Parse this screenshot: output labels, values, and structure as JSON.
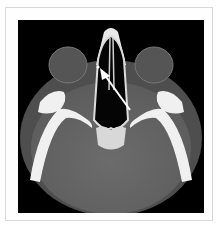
{
  "figure": {
    "type": "axial CT scan",
    "view": "axial orbits / paranasal sinuses",
    "annotation": "arrow",
    "colors": {
      "background": "#000000",
      "soft_tissue": "#5a5a5a",
      "brain": "#6a6a6a",
      "bone": "#f4f4f4",
      "frame": "#ffffff",
      "frame_border": "#d8d8d8"
    }
  }
}
